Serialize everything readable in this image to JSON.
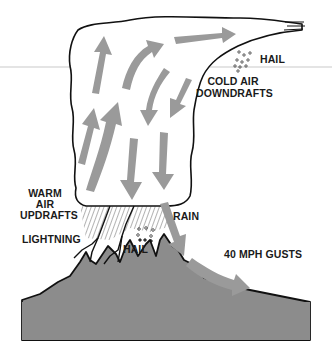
{
  "diagram": {
    "colors": {
      "arrow": "#9a9a9a",
      "mountain": "#8c8c8c",
      "outline": "#111111",
      "background": "#ffffff"
    },
    "labels": {
      "hail_top": "HAIL",
      "cold_air_line1": "COLD AIR",
      "cold_air_line2": "DOWNDRAFTS",
      "warm_air_line1": "WARM",
      "warm_air_line2": "AIR",
      "warm_air_line3": "UPDRAFTS",
      "lightning": "LIGHTNING",
      "rain": "RAIN",
      "hail_bottom": "HAIL",
      "gusts": "40 MPH GUSTS"
    }
  }
}
